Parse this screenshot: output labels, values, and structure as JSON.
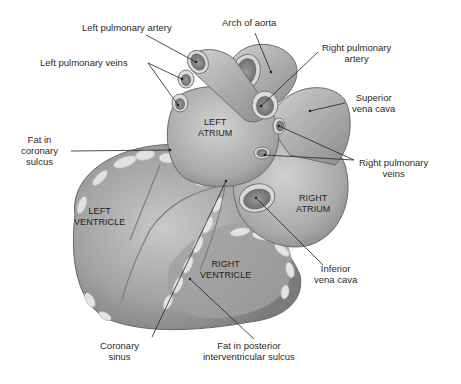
{
  "diagram": {
    "colors": {
      "background": "#ffffff",
      "tissue": "#a8a8a8",
      "tissue_dark": "#6f6f6f",
      "fat": "#dcdcdc",
      "line": "#222222",
      "text": "#2a2a2a"
    },
    "external_labels": [
      {
        "id": "left-pulmonary-artery",
        "lines": [
          "Left pulmonary artery"
        ]
      },
      {
        "id": "arch-of-aorta",
        "lines": [
          "Arch of aorta"
        ]
      },
      {
        "id": "right-pulmonary-artery",
        "lines": [
          "Right pulmonary",
          "artery"
        ]
      },
      {
        "id": "left-pulmonary-veins",
        "lines": [
          "Left pulmonary veins"
        ]
      },
      {
        "id": "superior-vena-cava",
        "lines": [
          "Superior",
          "vena cava"
        ]
      },
      {
        "id": "fat-in-coronary-sulcus",
        "lines": [
          "Fat in",
          "coronary",
          "sulcus"
        ]
      },
      {
        "id": "right-pulmonary-veins",
        "lines": [
          "Right pulmonary",
          "veins"
        ]
      },
      {
        "id": "inferior-vena-cava",
        "lines": [
          "Inferior",
          "vena cava"
        ]
      },
      {
        "id": "coronary-sinus",
        "lines": [
          "Coronary",
          "sinus"
        ]
      },
      {
        "id": "fat-in-posterior-interventricular-sulcus",
        "lines": [
          "Fat in posterior",
          "interventricular sulcus"
        ]
      }
    ],
    "internal_labels": [
      {
        "id": "left-atrium",
        "lines": [
          "LEFT",
          "ATRIUM"
        ]
      },
      {
        "id": "left-ventricle",
        "lines": [
          "LEFT",
          "VENTRICLE"
        ]
      },
      {
        "id": "right-atrium",
        "lines": [
          "RIGHT",
          "ATRIUM"
        ]
      },
      {
        "id": "right-ventricle",
        "lines": [
          "RIGHT",
          "VENTRICLE"
        ]
      }
    ]
  }
}
